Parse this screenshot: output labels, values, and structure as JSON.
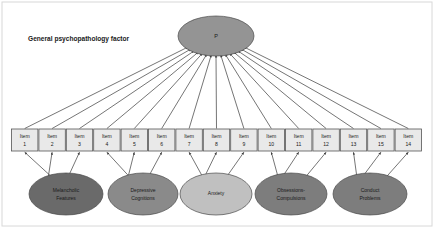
{
  "figure": {
    "caption": "General psychopathology factor",
    "caption_x": 28,
    "caption_y": 39,
    "width": 434,
    "height": 228,
    "background": "#ffffff",
    "frame": {
      "x": 2,
      "y": 2,
      "width": 430,
      "height": 224,
      "stroke": "#d8d8d8"
    }
  },
  "general_factor": {
    "label": "P",
    "cx": 216,
    "cy": 36,
    "rx": 38,
    "ry": 20,
    "fill": "#949494",
    "stroke": "#4a4a4a"
  },
  "items": [
    {
      "label": "Item",
      "number": "1",
      "cx": 24.7
    },
    {
      "label": "Item",
      "number": "2",
      "cx": 52.1
    },
    {
      "label": "Item",
      "number": "3",
      "cx": 79.5
    },
    {
      "label": "Item",
      "number": "4",
      "cx": 106.9
    },
    {
      "label": "Item",
      "number": "5",
      "cx": 134.3
    },
    {
      "label": "Item",
      "number": "6",
      "cx": 161.7
    },
    {
      "label": "Item",
      "number": "7",
      "cx": 189.1
    },
    {
      "label": "Item",
      "number": "8",
      "cx": 216.5
    },
    {
      "label": "Item",
      "number": "9",
      "cx": 243.9
    },
    {
      "label": "Item",
      "number": "10",
      "cx": 271.3
    },
    {
      "label": "Item",
      "number": "11",
      "cx": 298.7
    },
    {
      "label": "Item",
      "number": "12",
      "cx": 326.1
    },
    {
      "label": "Item",
      "number": "13",
      "cx": 353.5
    },
    {
      "label": "Item",
      "number": "15",
      "cx": 380.9
    },
    {
      "label": "Item",
      "number": "14",
      "cx": 408.3
    }
  ],
  "item_box": {
    "width": 26.4,
    "height": 22,
    "top": 129,
    "fill": "#e9e9e9",
    "stroke": "#555555"
  },
  "specific_factors": [
    {
      "label_line1": "Melancholic",
      "label_line2": "Features",
      "cx": 66,
      "cy": 194,
      "rx": 37,
      "ry": 21,
      "fill": "#6a6a6a",
      "items": [
        0,
        1,
        2
      ]
    },
    {
      "label_line1": "Depressive",
      "label_line2": "Cognitions",
      "cx": 143,
      "cy": 194,
      "rx": 35,
      "ry": 21,
      "fill": "#8a8a8a",
      "items": [
        3,
        4,
        5
      ]
    },
    {
      "label_line1": "Anxiety",
      "label_line2": "",
      "cx": 216,
      "cy": 194,
      "rx": 36,
      "ry": 21,
      "fill": "#c0c0c0",
      "items": [
        6,
        7,
        8
      ]
    },
    {
      "label_line1": "Obsessions-",
      "label_line2": "Compulsions",
      "cx": 291,
      "cy": 194,
      "rx": 36,
      "ry": 21,
      "fill": "#7d7d7d",
      "items": [
        9,
        10,
        11
      ]
    },
    {
      "label_line1": "Conduct",
      "label_line2": "Problems",
      "cx": 370,
      "cy": 194,
      "rx": 37,
      "ry": 21,
      "fill": "#7d7d7d",
      "items": [
        12,
        13,
        14
      ]
    }
  ],
  "chart_data": {
    "type": "diagram",
    "diagram_kind": "bifactor-sem-path-model",
    "title": "General psychopathology factor",
    "general_factor": "P",
    "indicators": [
      "Item 1",
      "Item 2",
      "Item 3",
      "Item 4",
      "Item 5",
      "Item 6",
      "Item 7",
      "Item 8",
      "Item 9",
      "Item 10",
      "Item 11",
      "Item 12",
      "Item 13",
      "Item 15",
      "Item 14"
    ],
    "specific_factors": [
      "Melancholic Features",
      "Depressive Cognitions",
      "Anxiety",
      "Obsessions-Compulsions",
      "Conduct Problems"
    ],
    "loadings_general": "P loads on all 15 items",
    "loadings_specific": [
      {
        "factor": "Melancholic Features",
        "items": [
          "Item 1",
          "Item 2",
          "Item 3"
        ]
      },
      {
        "factor": "Depressive Cognitions",
        "items": [
          "Item 4",
          "Item 5",
          "Item 6"
        ]
      },
      {
        "factor": "Anxiety",
        "items": [
          "Item 7",
          "Item 8",
          "Item 9"
        ]
      },
      {
        "factor": "Obsessions-Compulsions",
        "items": [
          "Item 10",
          "Item 11",
          "Item 12"
        ]
      },
      {
        "factor": "Conduct Problems",
        "items": [
          "Item 13",
          "Item 15",
          "Item 14"
        ]
      }
    ],
    "arrow_direction": "indicators point into latent factors"
  }
}
